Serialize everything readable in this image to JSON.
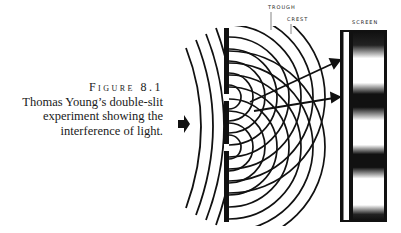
{
  "figure": {
    "label": "Figure 8.1",
    "caption_lines": [
      "Thomas Young’s double-slit",
      "experiment showing the",
      "interference of light."
    ]
  },
  "diagram": {
    "labels": {
      "trough": "TROUGH",
      "crest": "CREST",
      "screen": "SCREEN"
    },
    "incoming_arrow": "right-arrow",
    "slits_y": [
      97,
      147
    ],
    "screen_fringes": {
      "dark_bands_y": [
        40,
        92,
        152,
        215
      ],
      "bright_bands_y": [
        65,
        122,
        182
      ]
    },
    "colors": {
      "ink": "#111111",
      "paper": "#ffffff"
    }
  }
}
